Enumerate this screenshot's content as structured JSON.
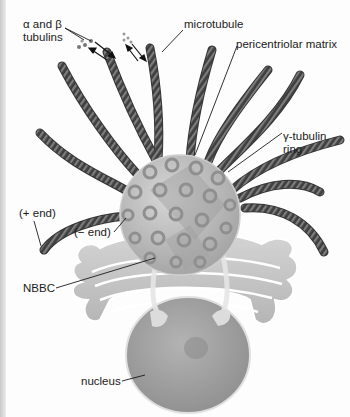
{
  "diagram": {
    "labels": {
      "tubulins_line1": "α and β",
      "tubulins_line2": "tubulins",
      "microtubule": "microtubule",
      "pericentriolar_matrix": "pericentriolar matrix",
      "gamma_ring_line1": "γ-tubulin",
      "gamma_ring_line2": "ring",
      "plus_end": "(+ end)",
      "minus_end": "(− end)",
      "nbbc": "NBBC",
      "nucleus": "nucleus"
    },
    "colors": {
      "background": "#fdfdfd",
      "microtubule": "#4a4a4a",
      "microtubule_stripe": "#7a7a7a",
      "centrosome": "#b9b9b9",
      "ring": "#9a9a9a",
      "golgi": "#c8c8c8",
      "nucleus": "#a6a6a6",
      "leader_line": "#1a1a1a"
    }
  }
}
